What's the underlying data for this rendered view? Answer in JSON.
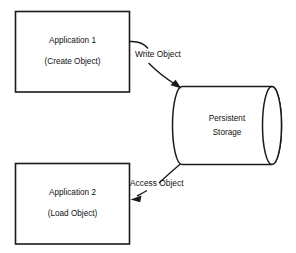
{
  "diagram": {
    "background_color": "#ffffff",
    "stroke_color": "#1a1a1a",
    "text_color": "#111111",
    "nodes": [
      {
        "id": "application-1",
        "shape": "rectangle",
        "line1": "Application 1",
        "line2": "(Create Object)"
      },
      {
        "id": "application-2",
        "shape": "rectangle",
        "line1": "Application 2",
        "line2": "(Load Object)"
      },
      {
        "id": "persistent-storage",
        "shape": "cylinder",
        "line1": "Persistent",
        "line2": "Storage"
      }
    ],
    "edges": [
      {
        "id": "write-object",
        "label": "Write Object",
        "from": "application-1",
        "to": "persistent-storage",
        "direction": "to-storage"
      },
      {
        "id": "access-object",
        "label": "Access Object",
        "from": "persistent-storage",
        "to": "application-2",
        "direction": "to-application"
      }
    ]
  }
}
